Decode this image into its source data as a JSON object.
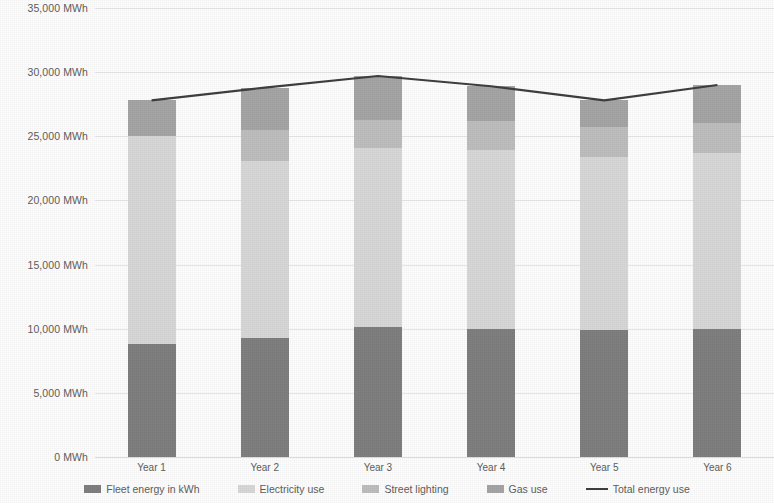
{
  "chart_data": {
    "type": "bar",
    "subtype": "stacked-bar-with-line",
    "title": "",
    "xlabel": "",
    "ylabel": "",
    "unit": "MWh",
    "categories": [
      "Year 1",
      "Year 2",
      "Year 3",
      "Year 4",
      "Year 5",
      "Year 6"
    ],
    "ylim": [
      0,
      35000
    ],
    "ytick_step": 5000,
    "ytick_labels": [
      "0 MWh",
      "5,000 MWh",
      "10,000 MWh",
      "15,000 MWh",
      "20,000 MWh",
      "25,000 MWh",
      "30,000 MWh",
      "35,000 MWh"
    ],
    "ytick_values": [
      0,
      5000,
      10000,
      15000,
      20000,
      25000,
      30000,
      35000
    ],
    "grid": true,
    "legend_position": "bottom",
    "series": [
      {
        "name": "Fleet energy in kWh",
        "color": "#808080",
        "stack_order": 0,
        "values": [
          8800,
          9300,
          10100,
          10000,
          9900,
          10000
        ]
      },
      {
        "name": "Electricity use",
        "color": "#d9d9d9",
        "stack_order": 1,
        "values": [
          16200,
          13800,
          14000,
          13900,
          13500,
          13700
        ]
      },
      {
        "name": "Street lighting",
        "color": "#bfbfbf",
        "stack_order": 2,
        "values": [
          0,
          2400,
          2200,
          2300,
          2300,
          2300
        ]
      },
      {
        "name": "Gas use",
        "color": "#a6a6a6",
        "stack_order": 3,
        "values": [
          2800,
          3300,
          3400,
          2700,
          2100,
          3000
        ]
      },
      {
        "name": "Total energy use",
        "color": "#3f3f3f",
        "type": "line",
        "values": [
          27800,
          28800,
          29700,
          28900,
          27800,
          29000
        ]
      }
    ]
  },
  "legend": {
    "items": [
      {
        "label": "Fleet energy in kWh",
        "color": "#808080",
        "marker": "box"
      },
      {
        "label": "Electricity use",
        "color": "#d9d9d9",
        "marker": "box"
      },
      {
        "label": "Street lighting",
        "color": "#bfbfbf",
        "marker": "box"
      },
      {
        "label": "Gas use",
        "color": "#a6a6a6",
        "marker": "box"
      },
      {
        "label": "Total energy use",
        "color": "#3f3f3f",
        "marker": "line"
      }
    ]
  }
}
